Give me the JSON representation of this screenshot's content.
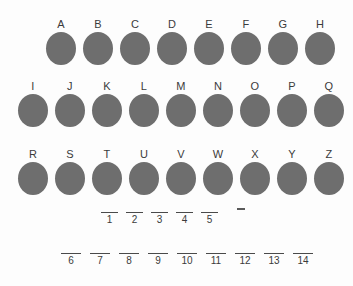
{
  "board": {
    "name": "letter-guess-board",
    "disc_color": "#6e6e6e",
    "text_color": "#3b3b3b",
    "background_color": "#fdfdfd",
    "letter_rows": [
      {
        "row_label": "row-1",
        "letters": [
          "A",
          "B",
          "C",
          "D",
          "E",
          "F",
          "G",
          "H"
        ]
      },
      {
        "row_label": "row-2",
        "letters": [
          "I",
          "J",
          "K",
          "L",
          "M",
          "N",
          "O",
          "P",
          "Q"
        ]
      },
      {
        "row_label": "row-3",
        "letters": [
          "R",
          "S",
          "T",
          "U",
          "V",
          "W",
          "X",
          "Y",
          "Z"
        ]
      }
    ],
    "answer_rows": [
      {
        "row_label": "blank-row-top",
        "indices": [
          "1",
          "2",
          "3",
          "4",
          "5"
        ],
        "values": [
          "",
          "",
          "",
          "",
          ""
        ]
      },
      {
        "row_label": "blank-row-bottom",
        "indices": [
          "6",
          "7",
          "8",
          "9",
          "10",
          "11",
          "12",
          "13",
          "14"
        ],
        "values": [
          "",
          "",
          "",
          "",
          "",
          "",
          "",
          "",
          ""
        ]
      }
    ],
    "trailing_mark": "-"
  }
}
